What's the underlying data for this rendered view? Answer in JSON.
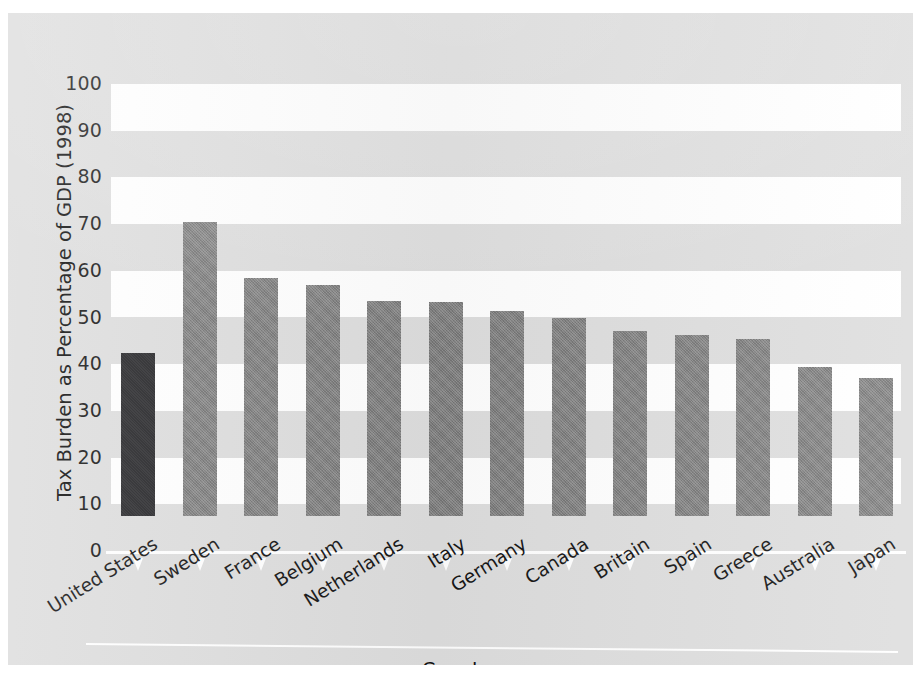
{
  "chart_data": {
    "type": "bar",
    "title": "",
    "xlabel": "Country",
    "ylabel": "Tax Burden as Percentage of GDP (1998)",
    "ylim": [
      0,
      100
    ],
    "yticks": [
      100,
      90,
      80,
      70,
      60,
      50,
      40,
      30,
      20,
      10,
      0
    ],
    "grid": "horizontal alternating white bands",
    "legend": "none",
    "categories": [
      "United States",
      "Sweden",
      "France",
      "Belgium",
      "Netherlands",
      "Italy",
      "Germany",
      "Canada",
      "Britain",
      "Spain",
      "Greece",
      "Australia",
      "Japan"
    ],
    "values": [
      34.8,
      63.0,
      50.9,
      49.5,
      46.0,
      45.8,
      43.8,
      42.5,
      39.6,
      38.7,
      37.9,
      32.0,
      29.5
    ],
    "highlight_index": 0,
    "bar_colors": {
      "default": "#7e7e7e",
      "highlight": "#262629"
    }
  },
  "axes": {
    "y_title": "Tax Burden as Percentage of GDP (1998)",
    "x_title": "Country",
    "y_tick_labels": [
      "100",
      "90",
      "80",
      "70",
      "60",
      "50",
      "40",
      "30",
      "20",
      "10",
      "0"
    ]
  },
  "bars": [
    {
      "label": "United States",
      "value": 34.8,
      "highlight": true
    },
    {
      "label": "Sweden",
      "value": 63.0,
      "highlight": false
    },
    {
      "label": "France",
      "value": 50.9,
      "highlight": false
    },
    {
      "label": "Belgium",
      "value": 49.5,
      "highlight": false
    },
    {
      "label": "Netherlands",
      "value": 46.0,
      "highlight": false
    },
    {
      "label": "Italy",
      "value": 45.8,
      "highlight": false
    },
    {
      "label": "Germany",
      "value": 43.8,
      "highlight": false
    },
    {
      "label": "Canada",
      "value": 42.5,
      "highlight": false
    },
    {
      "label": "Britain",
      "value": 39.6,
      "highlight": false
    },
    {
      "label": "Spain",
      "value": 38.7,
      "highlight": false
    },
    {
      "label": "Greece",
      "value": 37.9,
      "highlight": false
    },
    {
      "label": "Australia",
      "value": 32.0,
      "highlight": false
    },
    {
      "label": "Japan",
      "value": 29.5,
      "highlight": false
    }
  ],
  "style": {
    "panel_background": "#dedede",
    "band_color": "#ffffff",
    "text_color": "#151515"
  }
}
